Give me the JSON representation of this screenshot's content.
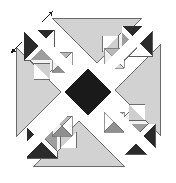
{
  "figure": {
    "title": "Recursive pinwheel tiling",
    "canvas": {
      "width": 176,
      "height": 183
    },
    "background_color": "#ffffff",
    "symmetry": "4-fold rotational (90 degrees) about center",
    "center": {
      "x": 88,
      "y": 92
    },
    "recursion_levels": 3,
    "scale_ratio": 0.5
  },
  "palette": {
    "background": "#ffffff",
    "white": "#ffffff",
    "light_gray": "#d2d2d2",
    "pale_gray": "#e6e6e6",
    "mid_gray": "#a8a8a8",
    "dark_gray": "#7a7a7a",
    "near_black": "#2b2b2b",
    "black": "#1a1a1a",
    "outline": "#555555",
    "arrow": "#1a1a1a"
  },
  "elements": {
    "center_diamond": {
      "name": "center-black-diamond",
      "fill": "#1a1a1a",
      "half_size": 23,
      "center": {
        "x": 88,
        "y": 92
      }
    },
    "large_triangles": [
      {
        "name": "large-triangle-top",
        "direction": "down",
        "fill": "#d2d2d2",
        "points": "52,18 142,18 97,63"
      },
      {
        "name": "large-triangle-left",
        "direction": "right",
        "fill": "#d2d2d2",
        "points": "16,47 16,137 61,92"
      },
      {
        "name": "large-triangle-bottom",
        "direction": "up",
        "fill": "#d2d2d2",
        "points": "34,166 124,166 79,121"
      },
      {
        "name": "large-triangle-right",
        "direction": "left",
        "fill": "#d2d2d2",
        "points": "160,45 160,135 115,90"
      }
    ],
    "corner_motifs": [
      {
        "name": "corner-motif-top-left",
        "rotation": 0,
        "origin": {
          "x": 25,
          "y": 31
        },
        "size": 30
      },
      {
        "name": "corner-motif-top-right",
        "rotation": 90,
        "origin": {
          "x": 121,
          "y": 27
        },
        "size": 30
      },
      {
        "name": "corner-motif-bottom-right",
        "rotation": 180,
        "origin": {
          "x": 125,
          "y": 123
        },
        "size": 30
      },
      {
        "name": "corner-motif-bottom-left",
        "rotation": 270,
        "origin": {
          "x": 29,
          "y": 127
        },
        "size": 30
      }
    ],
    "arrow_marks": [
      {
        "name": "arrow-mark-outer-top",
        "x": 47,
        "y": 16,
        "angle": -45,
        "length": 13
      },
      {
        "name": "arrow-mark-outer-left",
        "x": 17,
        "y": 48,
        "angle": -45,
        "length": 13
      },
      {
        "name": "arrow-mark-inner-center",
        "x": 86,
        "y": 78,
        "angle": -45,
        "length": 11
      }
    ],
    "diagonal_bands": {
      "name": "white-diagonal-bands",
      "color": "#ffffff",
      "orientation": "both diagonals through center",
      "width": 11
    }
  },
  "legend": {
    "visible": false,
    "items": []
  }
}
